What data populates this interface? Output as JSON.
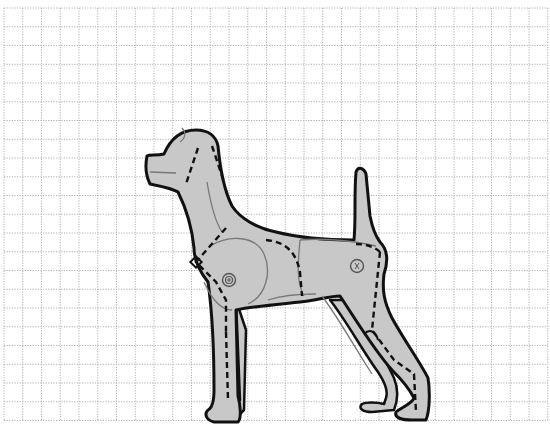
{
  "diagram": {
    "grid": {
      "origin_x": 4,
      "origin_y": 8,
      "spacing": 18.75,
      "columns": 29,
      "rows": 22,
      "line_color": "#b0b0b0",
      "line_style": "dotted"
    },
    "colors": {
      "background": "#ffffff",
      "body_fill": "#c8c8c8",
      "outline": "#111111",
      "seam_dashed": "#111111",
      "joint_lines": "#777777"
    },
    "markers": [
      {
        "name": "shoulder-joint-marker",
        "glyph": "⊕"
      },
      {
        "name": "hip-joint-marker",
        "glyph": "⊗"
      }
    ]
  }
}
